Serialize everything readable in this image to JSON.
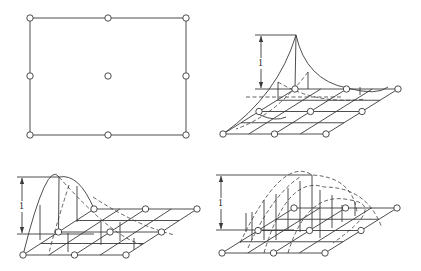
{
  "colors": {
    "stroke": "#3a3a3a",
    "node_fill": "#ffffff",
    "background": "#ffffff"
  },
  "panels": [
    {
      "id": "element-plan",
      "type": "plan",
      "rect": [
        30,
        18,
        186,
        135
      ],
      "nodes": [
        [
          30,
          18
        ],
        [
          108,
          18
        ],
        [
          186,
          18
        ],
        [
          30,
          76
        ],
        [
          108,
          76
        ],
        [
          186,
          76
        ],
        [
          30,
          135
        ],
        [
          108,
          135
        ],
        [
          186,
          135
        ]
      ]
    },
    {
      "id": "corner-node-shape-function",
      "type": "surface",
      "label": "1",
      "grid": {
        "back": [
          [
            295,
            89
          ],
          [
            347,
            88
          ],
          [
            398,
            89
          ]
        ],
        "front": [
          [
            223,
            134
          ],
          [
            275,
            134
          ],
          [
            326,
            134
          ]
        ]
      },
      "peak": [
        296,
        35
      ],
      "dimension": {
        "x": 261,
        "top": 35,
        "bottom": 89,
        "x_start": 255,
        "label_pos": [
          258,
          66
        ]
      }
    },
    {
      "id": "midside-node-shape-function",
      "type": "surface",
      "label": "1",
      "grid": {
        "back": [
          [
            94,
            209
          ],
          [
            145,
            209
          ],
          [
            197,
            209
          ]
        ],
        "front": [
          [
            23,
            255
          ],
          [
            75,
            255
          ],
          [
            126,
            255
          ]
        ]
      },
      "peak": [
        59,
        177
      ],
      "dimension": {
        "x": 22,
        "top": 177,
        "bottom": 234,
        "x_start": 17,
        "label_pos": [
          19,
          209
        ]
      }
    },
    {
      "id": "center-node-shape-function",
      "type": "surface",
      "label": "1",
      "grid": {
        "back": [
          [
            294,
            208
          ],
          [
            345,
            208
          ],
          [
            397,
            208
          ]
        ],
        "front": [
          [
            222,
            253
          ],
          [
            273,
            253
          ],
          [
            325,
            253
          ]
        ]
      },
      "peak": [
        312,
        175
      ],
      "dimension": {
        "x": 221,
        "top": 175,
        "bottom": 230,
        "x_start": 216,
        "label_pos": [
          218,
          206
        ]
      }
    }
  ]
}
